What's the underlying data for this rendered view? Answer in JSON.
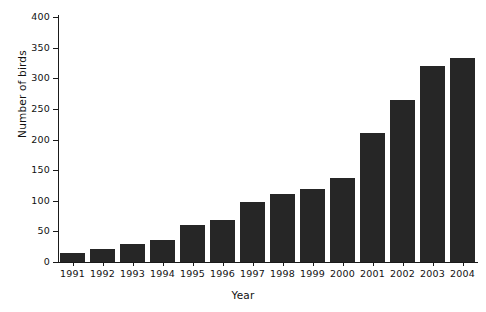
{
  "chart_data": {
    "type": "bar",
    "title": "",
    "xlabel": "Year",
    "ylabel": "Number of birds",
    "categories": [
      "1991",
      "1992",
      "1993",
      "1994",
      "1995",
      "1996",
      "1997",
      "1998",
      "1999",
      "2000",
      "2001",
      "2002",
      "2003",
      "2004"
    ],
    "values": [
      15,
      22,
      29,
      36,
      60,
      68,
      98,
      111,
      119,
      137,
      210,
      264,
      320,
      333
    ],
    "ylim": [
      0,
      400
    ],
    "ytick_labels": [
      "0",
      "50",
      "100",
      "150",
      "200",
      "250",
      "300",
      "350",
      "400"
    ],
    "ytick_values": [
      0,
      50,
      100,
      150,
      200,
      250,
      300,
      350,
      400
    ],
    "grid": false,
    "legend": null,
    "bar_color": "#262626",
    "axis_color": "#1a1a1a",
    "background_color": "#ffffff"
  }
}
